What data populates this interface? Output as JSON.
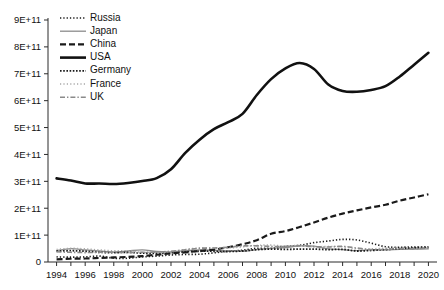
{
  "chart_data": {
    "type": "line",
    "title": "",
    "xlabel": "",
    "ylabel": "",
    "xlim": [
      1993.4,
      2020.6
    ],
    "ylim": [
      0,
      900000000000
    ],
    "grid": false,
    "legend_position": "top-left",
    "x": [
      1994,
      1995,
      1996,
      1997,
      1998,
      1999,
      2000,
      2001,
      2002,
      2003,
      2004,
      2005,
      2006,
      2007,
      2008,
      2009,
      2010,
      2011,
      2012,
      2013,
      2014,
      2015,
      2016,
      2017,
      2018,
      2019,
      2020
    ],
    "xtick_labels": [
      "1994",
      "1996",
      "1998",
      "2000",
      "2002",
      "2004",
      "2006",
      "2008",
      "2010",
      "2012",
      "2014",
      "2016",
      "2018",
      "2020"
    ],
    "xtick_values": [
      1994,
      1996,
      1998,
      2000,
      2002,
      2004,
      2006,
      2008,
      2010,
      2012,
      2014,
      2016,
      2018,
      2020
    ],
    "ytick_labels": [
      "0",
      "1E+11",
      "2E+11",
      "3E+11",
      "4E+11",
      "5E+11",
      "6E+11",
      "7E+11",
      "8E+11",
      "9E+11"
    ],
    "ytick_values": [
      0,
      100000000000,
      200000000000,
      300000000000,
      400000000000,
      500000000000,
      600000000000,
      700000000000,
      800000000000,
      900000000000
    ],
    "series": [
      {
        "name": "Russia",
        "style": "dotted",
        "color": "#1a1a1a",
        "width": 1.6,
        "dash": "1.3,2.0",
        "values": [
          19000000000,
          18000000000,
          19000000000,
          22000000000,
          14000000000,
          14000000000,
          19000000000,
          22000000000,
          26000000000,
          28000000000,
          29000000000,
          34000000000,
          40000000000,
          44000000000,
          51000000000,
          51000000000,
          58000000000,
          62000000000,
          72000000000,
          78000000000,
          84000000000,
          82000000000,
          70000000000,
          57000000000,
          55000000000,
          56000000000,
          54000000000
        ]
      },
      {
        "name": "Japan",
        "style": "solid-thin",
        "color": "#8c8c8c",
        "width": 1.3,
        "dash": "",
        "values": [
          42000000000,
          50000000000,
          45000000000,
          41000000000,
          37000000000,
          41000000000,
          45000000000,
          39000000000,
          38000000000,
          42000000000,
          45000000000,
          44000000000,
          41000000000,
          40000000000,
          46000000000,
          51000000000,
          54000000000,
          60000000000,
          59000000000,
          49000000000,
          46000000000,
          42000000000,
          46000000000,
          45000000000,
          47000000000,
          48000000000,
          49000000000
        ]
      },
      {
        "name": "China",
        "style": "dashed",
        "color": "#1a1a1a",
        "width": 2.2,
        "dash": "6,3",
        "values": [
          10000000000,
          12000000000,
          13000000000,
          15000000000,
          17000000000,
          19000000000,
          22000000000,
          27000000000,
          32000000000,
          36000000000,
          41000000000,
          46000000000,
          55000000000,
          66000000000,
          81000000000,
          105000000000,
          115000000000,
          130000000000,
          147000000000,
          165000000000,
          180000000000,
          192000000000,
          203000000000,
          213000000000,
          228000000000,
          240000000000,
          252000000000
        ]
      },
      {
        "name": "USA",
        "style": "solid-thick",
        "color": "#111111",
        "width": 2.6,
        "dash": "",
        "values": [
          311000000000,
          303000000000,
          292000000000,
          292000000000,
          290000000000,
          294000000000,
          301000000000,
          312000000000,
          345000000000,
          406000000000,
          455000000000,
          494000000000,
          520000000000,
          551000000000,
          621000000000,
          680000000000,
          720000000000,
          740000000000,
          718000000000,
          660000000000,
          636000000000,
          633000000000,
          640000000000,
          654000000000,
          690000000000,
          734000000000,
          778000000000
        ]
      },
      {
        "name": "Germany",
        "style": "dotted-heavy",
        "color": "#1a1a1a",
        "width": 1.8,
        "dash": "1.6,1.6",
        "values": [
          40000000000,
          42000000000,
          40000000000,
          36000000000,
          35000000000,
          36000000000,
          33000000000,
          32000000000,
          34000000000,
          38000000000,
          40000000000,
          40000000000,
          39000000000,
          41000000000,
          46000000000,
          48000000000,
          47000000000,
          48000000000,
          48000000000,
          46000000000,
          47000000000,
          41000000000,
          43000000000,
          46000000000,
          50000000000,
          53000000000,
          56000000000
        ]
      },
      {
        "name": "France",
        "style": "dotted-light",
        "color": "#a8a8a8",
        "width": 1.4,
        "dash": "1.2,2.2",
        "values": [
          47000000000,
          51000000000,
          49000000000,
          45000000000,
          42000000000,
          42000000000,
          36000000000,
          35000000000,
          38000000000,
          47000000000,
          52000000000,
          52000000000,
          52000000000,
          56000000000,
          62000000000,
          63000000000,
          60000000000,
          62000000000,
          57000000000,
          58000000000,
          57000000000,
          49000000000,
          49000000000,
          52000000000,
          54000000000,
          53000000000,
          53000000000
        ]
      },
      {
        "name": "UK",
        "style": "dash-dot",
        "color": "#8a8a8a",
        "width": 1.6,
        "dash": "5,2,1.4,2",
        "values": [
          38000000000,
          36000000000,
          35000000000,
          36000000000,
          36000000000,
          35000000000,
          36000000000,
          37000000000,
          40000000000,
          45000000000,
          51000000000,
          52000000000,
          55000000000,
          60000000000,
          60000000000,
          58000000000,
          58000000000,
          60000000000,
          57000000000,
          56000000000,
          58000000000,
          52000000000,
          46000000000,
          47000000000,
          50000000000,
          49000000000,
          52000000000
        ]
      }
    ]
  },
  "legend": {
    "items": [
      {
        "label": "Russia"
      },
      {
        "label": "Japan"
      },
      {
        "label": "China"
      },
      {
        "label": "USA"
      },
      {
        "label": "Germany"
      },
      {
        "label": "France"
      },
      {
        "label": "UK"
      }
    ]
  }
}
